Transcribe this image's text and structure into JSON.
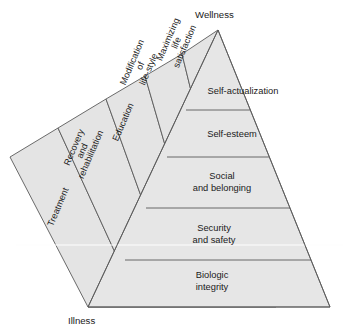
{
  "diagram": {
    "poles": {
      "top_label": "Wellness",
      "bottom_label": "Illness"
    },
    "colors": {
      "facet_fill": "#e6e6e6",
      "outline": "#5a5a5a",
      "text": "#1a1a1a",
      "highlight_line": "#fdfdfd",
      "background": "#ffffff"
    },
    "tiers": [
      {
        "id": "self-actualization",
        "label": "Self-actualization",
        "lines": [
          "Self-actualization"
        ]
      },
      {
        "id": "self-esteem",
        "label": "Self-esteem",
        "lines": [
          "Self-esteem"
        ]
      },
      {
        "id": "social-and-belonging",
        "label": "Social and belonging",
        "lines": [
          "Social",
          "and belonging"
        ]
      },
      {
        "id": "security-and-safety",
        "label": "Security and safety",
        "lines": [
          "Security",
          "and safety"
        ]
      },
      {
        "id": "biologic-integrity",
        "label": "Biologic integrity",
        "lines": [
          "Biologic",
          "integrity"
        ]
      }
    ],
    "bands": [
      {
        "id": "maximizing-life-satisfaction",
        "label": "Maximizing life satisfaction",
        "lines": [
          "Maximizing",
          "life",
          "satisfaction"
        ]
      },
      {
        "id": "modification-of-life-style",
        "label": "Modification of life-style",
        "lines": [
          "Modification",
          "of",
          "life-style"
        ]
      },
      {
        "id": "education",
        "label": "Education",
        "lines": [
          "Education"
        ]
      },
      {
        "id": "recovery-and-rehabilitation",
        "label": "Recovery and rehabilitation",
        "lines": [
          "Recovery",
          "and",
          "rehabilitation"
        ]
      },
      {
        "id": "treatment",
        "label": "Treatment",
        "lines": [
          "Treatment"
        ]
      }
    ]
  }
}
